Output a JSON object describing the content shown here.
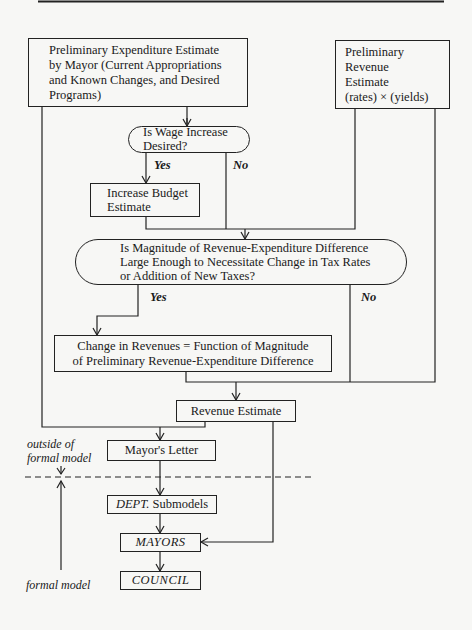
{
  "diagram": {
    "nodes": {
      "expenditure": {
        "lines": [
          "Preliminary Expenditure Estimate",
          "by Mayor (Current Appropriations",
          "and Known Changes, and Desired",
          "Programs)"
        ]
      },
      "revenue_prelim": {
        "lines": [
          "Preliminary",
          "Revenue",
          "Estimate",
          "(rates) × (yields)"
        ]
      },
      "decision_wage": {
        "lines": [
          "Is Wage Increase",
          "Desired?"
        ]
      },
      "increase_budget": {
        "lines": [
          "Increase Budget",
          "Estimate"
        ]
      },
      "decision_magnitude": {
        "lines": [
          "Is Magnitude of Revenue-Expenditure Difference",
          "Large Enough to Necessitate Change in Tax Rates",
          "or Addition of New Taxes?"
        ]
      },
      "change_revenues": {
        "lines": [
          "Change in Revenues = Function of Magnitude",
          "of Preliminary Revenue-Expenditure Difference"
        ]
      },
      "revenue_estimate": {
        "label": "Revenue Estimate"
      },
      "mayors_letter": {
        "label": "Mayor's Letter"
      },
      "dept_submodels": {
        "label_italic": "DEPT.",
        "label_rest": " Submodels"
      },
      "mayors": {
        "label": "MAYORS"
      },
      "council": {
        "label": "COUNCIL"
      }
    },
    "edge_labels": {
      "wage_yes": "Yes",
      "wage_no": "No",
      "magnitude_yes": "Yes",
      "magnitude_no": "No"
    },
    "annotations": {
      "outside_line1": "outside of",
      "outside_line2": "formal model",
      "formal_model": "formal model"
    }
  }
}
